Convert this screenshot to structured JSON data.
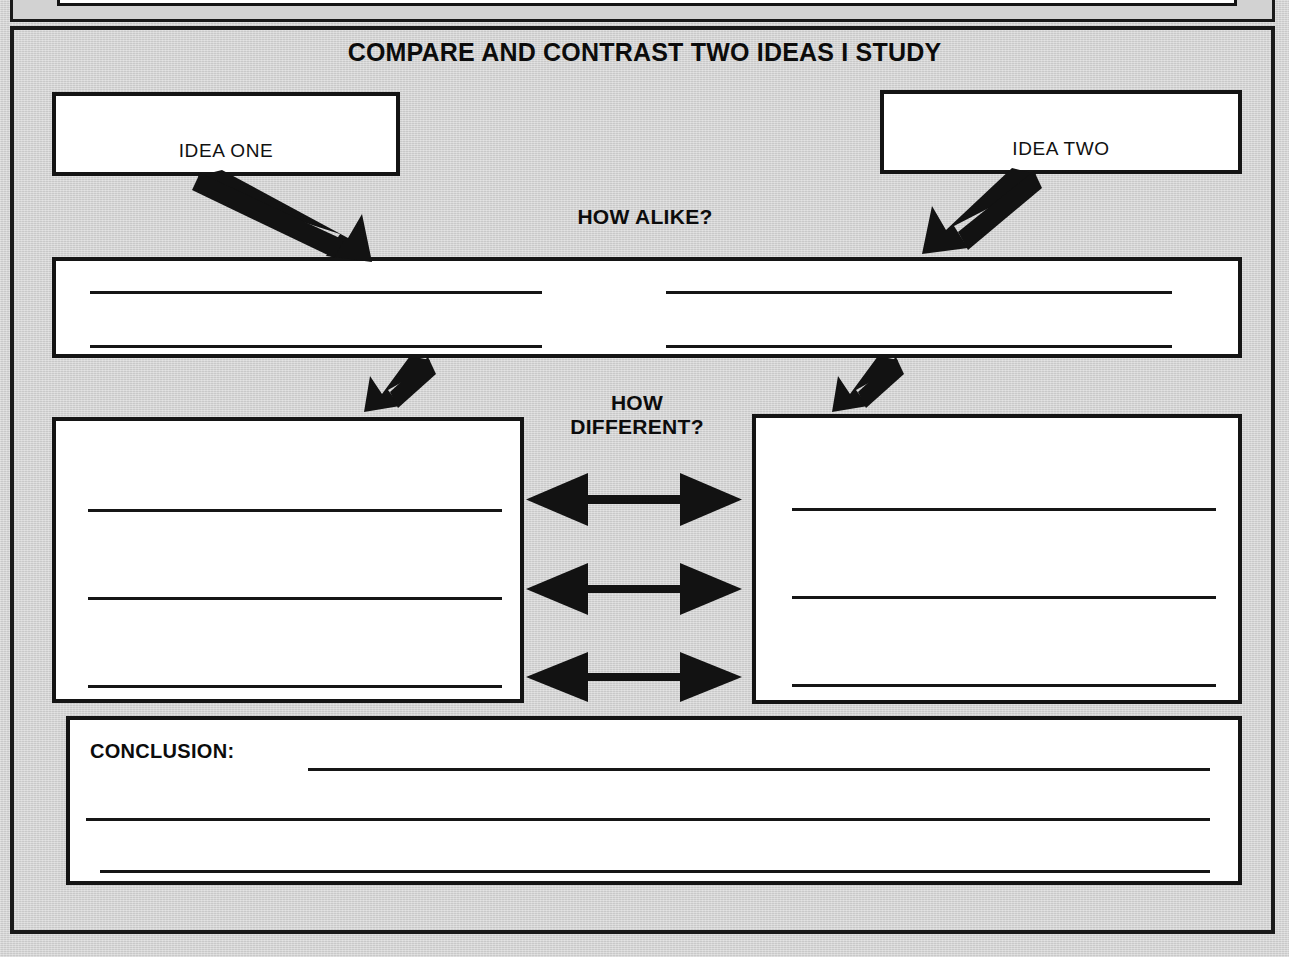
{
  "worksheet": {
    "title": "COMPARE AND CONTRAST TWO IDEAS I STUDY",
    "background_color": "#d2d2d2",
    "ink_color": "#141414",
    "field_color": "#ffffff"
  },
  "idea_boxes": [
    {
      "label": "IDEA ONE",
      "name": "idea-one"
    },
    {
      "label": "IDEA TWO",
      "name": "idea-two"
    }
  ],
  "alike_section": {
    "caption": "HOW ALIKE?",
    "line_rows": 2,
    "columns_per_row": 2,
    "lines": [
      {
        "row": 1,
        "column": "left"
      },
      {
        "row": 1,
        "column": "right"
      },
      {
        "row": 2,
        "column": "left"
      },
      {
        "row": 2,
        "column": "right"
      }
    ]
  },
  "different_section": {
    "caption": "HOW\nDIFFERENT?",
    "caption_line_1": "HOW",
    "caption_line_2": "DIFFERENT?",
    "left_box_lines": 3,
    "right_box_lines": 3,
    "connector_arrows": 3,
    "connector_arrow_style": "double-headed"
  },
  "conclusion_section": {
    "label": "CONCLUSION:",
    "lines": 3
  },
  "arrows": [
    {
      "name": "idea-one-to-alike",
      "direction": "down-right"
    },
    {
      "name": "idea-two-to-alike",
      "direction": "down-left"
    },
    {
      "name": "alike-to-difference-left",
      "direction": "down-left"
    },
    {
      "name": "alike-to-difference-right",
      "direction": "down-left"
    }
  ]
}
